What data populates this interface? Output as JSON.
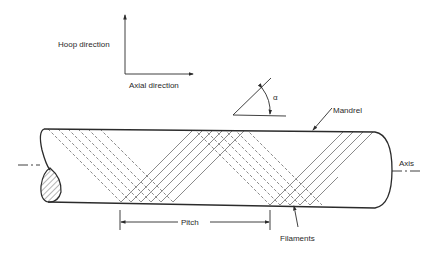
{
  "diagram": {
    "labels": {
      "hoop": "Hoop direction",
      "axial": "Axial direction",
      "alpha": "α",
      "mandrel": "Mandrel",
      "axis": "Axis",
      "pitch": "Pitch",
      "filaments": "Filaments"
    },
    "colors": {
      "line": "#2b2b2b",
      "background": "#ffffff"
    }
  }
}
